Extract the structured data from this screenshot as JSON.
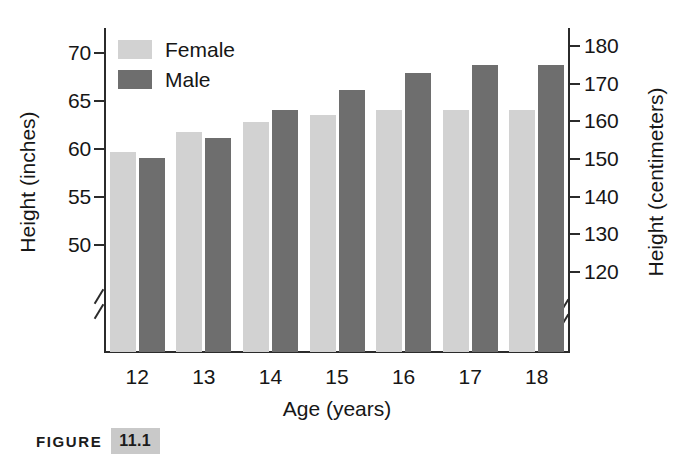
{
  "figure": {
    "label": "FIGURE",
    "number": "11.1"
  },
  "legend": {
    "items": [
      {
        "label": "Female",
        "color": "#d2d2d2",
        "swatch_name": "legend-swatch-female"
      },
      {
        "label": "Male",
        "color": "#6e6e6e",
        "swatch_name": "legend-swatch-male"
      }
    ]
  },
  "chart_data": {
    "type": "bar",
    "title": "",
    "subtitle": "",
    "xlabel": "Age (years)",
    "ylabel": "Height (inches)",
    "y2label": "Height (centimeters)",
    "categories": [
      "12",
      "13",
      "14",
      "15",
      "16",
      "17",
      "18"
    ],
    "series": [
      {
        "name": "Female",
        "color": "#d2d2d2",
        "values": [
          59.6,
          61.7,
          62.7,
          63.4,
          64.0,
          64.0,
          64.0
        ]
      },
      {
        "name": "Male",
        "color": "#6e6e6e",
        "values": [
          59.0,
          61.0,
          64.0,
          66.0,
          67.8,
          68.6,
          68.6
        ]
      }
    ],
    "ylim": [
      47.5,
      71.5
    ],
    "yticks": [
      "50",
      "55",
      "60",
      "65",
      "70"
    ],
    "ytick_values": [
      50,
      55,
      60,
      65,
      70
    ],
    "y2lim": [
      120.65,
      181.61
    ],
    "y2ticks": [
      "120",
      "130",
      "140",
      "150",
      "160",
      "170",
      "180"
    ],
    "y2tick_values": [
      120,
      130,
      140,
      150,
      160,
      170,
      180
    ],
    "xticks": [
      "12",
      "13",
      "14",
      "15",
      "16",
      "17",
      "18"
    ],
    "grid": false,
    "legend_position": "upper left",
    "axis_break": "y-axis broken below lowest tick on both left and right spines"
  }
}
